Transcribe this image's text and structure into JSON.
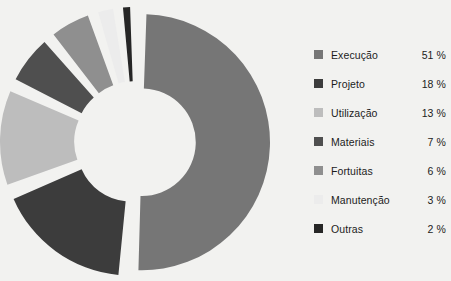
{
  "chart_data": {
    "type": "pie",
    "variant": "donut-exploded",
    "title": "",
    "subtitle": "",
    "xlabel": "",
    "ylabel": "",
    "grid": false,
    "legend_position": "right",
    "value_unit": "%",
    "start_angle_deg": 0,
    "direction": "clockwise",
    "inner_radius_ratio": 0.42,
    "slice_gap_deg": 4,
    "background_color": "#f2f2f0",
    "categories": [
      "Execução",
      "Projeto",
      "Utilização",
      "Materiais",
      "Fortuitas",
      "Manutenção",
      "Outras"
    ],
    "values": [
      51,
      18,
      13,
      7,
      6,
      3,
      2
    ],
    "colors": [
      "#767676",
      "#3c3c3c",
      "#bdbdbd",
      "#4f4f4f",
      "#8f8f8f",
      "#ececec",
      "#262626"
    ],
    "series": [
      {
        "name": "Distribuição",
        "values": [
          51,
          18,
          13,
          7,
          6,
          3,
          2
        ]
      }
    ]
  },
  "legend": {
    "items": [
      {
        "label": "Execução",
        "value": "51 %",
        "percent": 51,
        "color": "#767676"
      },
      {
        "label": "Projeto",
        "value": "18 %",
        "percent": 18,
        "color": "#3c3c3c"
      },
      {
        "label": "Utilização",
        "value": "13 %",
        "percent": 13,
        "color": "#bdbdbd"
      },
      {
        "label": "Materiais",
        "value": "7 %",
        "percent": 7,
        "color": "#4f4f4f"
      },
      {
        "label": "Fortuitas",
        "value": "6 %",
        "percent": 6,
        "color": "#8f8f8f"
      },
      {
        "label": "Manutenção",
        "value": "3 %",
        "percent": 3,
        "color": "#ececec"
      },
      {
        "label": "Outras",
        "value": "2 %",
        "percent": 2,
        "color": "#262626"
      }
    ]
  }
}
